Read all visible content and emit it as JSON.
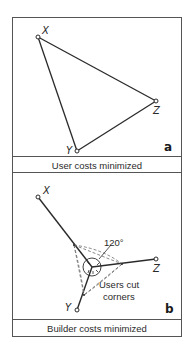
{
  "panels": [
    {
      "id": "a",
      "letter": "a",
      "caption": "User costs minimized",
      "nodes": [
        {
          "label": "X",
          "x": 25,
          "y": 19
        },
        {
          "label": "Z",
          "x": 143,
          "y": 83
        },
        {
          "label": "Y",
          "x": 64,
          "y": 133
        }
      ],
      "edges": [
        [
          "X",
          "Z"
        ],
        [
          "Z",
          "Y"
        ],
        [
          "Y",
          "X"
        ]
      ]
    },
    {
      "id": "b",
      "letter": "b",
      "caption": "Builder costs minimized",
      "nodes": [
        {
          "label": "X",
          "x": 25,
          "y": 24
        },
        {
          "label": "Z",
          "x": 143,
          "y": 86
        },
        {
          "label": "Y",
          "x": 64,
          "y": 137
        }
      ],
      "junction": {
        "x": 79,
        "y": 94
      },
      "angle_label": "120°",
      "annotation_line1": "Users cut",
      "annotation_line2": "corners"
    }
  ],
  "colors": {
    "line": "#2a2a2a",
    "frame": "#555555",
    "dashed": "#6a6a6a"
  }
}
